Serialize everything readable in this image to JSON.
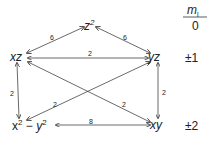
{
  "nodes": {
    "z2": {
      "base": "z",
      "sup": "2"
    },
    "xz": {
      "label": "xz"
    },
    "yz": {
      "label": "yz"
    },
    "x2y2": {
      "x": "x",
      "xsup": "2",
      "minus": " − ",
      "y": "y",
      "ysup": "2"
    },
    "xy": {
      "label": "xy"
    }
  },
  "edges": [
    {
      "from": "xz",
      "to": "z2",
      "weight": "6"
    },
    {
      "from": "z2",
      "to": "yz",
      "weight": "6"
    },
    {
      "from": "xz",
      "to": "yz",
      "weight": "2"
    },
    {
      "from": "xz",
      "to": "x2y2",
      "weight": "2"
    },
    {
      "from": "yz",
      "to": "xy",
      "weight": "2"
    },
    {
      "from": "yz",
      "to": "x2y2",
      "weight": "2"
    },
    {
      "from": "xz",
      "to": "xy",
      "weight": "2"
    },
    {
      "from": "x2y2",
      "to": "xy",
      "weight": "8"
    }
  ],
  "ml_column": {
    "header": "m",
    "header_sub": "l",
    "rows": [
      "0",
      "±1",
      "±2"
    ]
  }
}
